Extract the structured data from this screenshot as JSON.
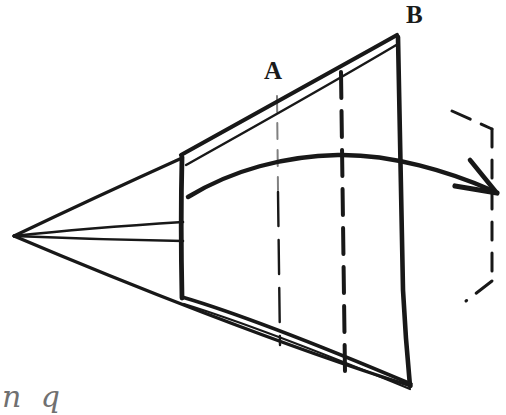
{
  "figure": {
    "background_color": "#ffffff",
    "ink_color": "#181818",
    "width": 506,
    "height": 415,
    "labels": {
      "vertex_a": "A",
      "vertex_b": "B",
      "caption_fragment": "n q"
    },
    "annotations": {
      "apex_point": "14,236",
      "vertex_a_point": "277,96",
      "vertex_b_point": "398,36",
      "rotation_arrow": "curved-arrow-right",
      "ghost_outline": "dashed-bracket"
    }
  },
  "geometry": {
    "apex": {
      "x": 14,
      "y": 236
    },
    "body_top_left": {
      "x": 182,
      "y": 158
    },
    "body_bottom_left": {
      "x": 182,
      "y": 298
    },
    "body_top_right": {
      "x": 398,
      "y": 36
    },
    "body_bottom_right": {
      "x": 410,
      "y": 385
    },
    "wedge_upper": {
      "x": 182,
      "y": 222
    },
    "wedge_lower": {
      "x": 182,
      "y": 241
    },
    "dashed_line_thin_x": 278,
    "dashed_line_thick_x": 342,
    "arc_start": {
      "x": 188,
      "y": 197
    },
    "arc_peak": {
      "x": 338,
      "y": 155
    },
    "arrow_tip": {
      "x": 496,
      "y": 191
    },
    "ghost_top": {
      "x": 452,
      "y": 110
    },
    "ghost_right_x": 492,
    "ghost_bottom": {
      "x": 466,
      "y": 301
    }
  }
}
